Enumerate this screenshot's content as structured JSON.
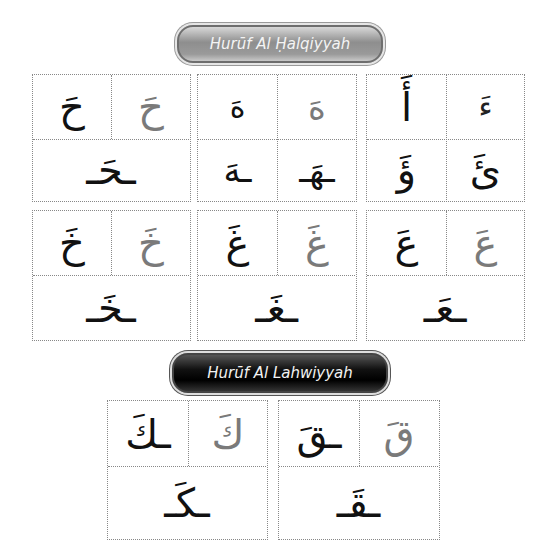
{
  "sections": [
    {
      "title": "Hurūf Al Ḥalqiyyah",
      "groups": [
        {
          "top_left": "حَ",
          "top_right": "حَ",
          "bottom": "ـحَـ"
        },
        {
          "top_left": "هَ",
          "top_right": "هَ",
          "bottom_left": "ـهَ",
          "bottom_right": "ـهَـ"
        },
        {
          "top_left": "أَ",
          "top_right": "ءَ",
          "bottom_left": "ؤَ",
          "bottom_right": "ئَ"
        },
        {
          "top_left": "خَ",
          "top_right": "خَ",
          "bottom": "ـخَـ"
        },
        {
          "top_left": "غَ",
          "top_right": "غَ",
          "bottom": "ـغَـ"
        },
        {
          "top_left": "عَ",
          "top_right": "عَ",
          "bottom": "ـعَـ"
        }
      ]
    },
    {
      "title": "Hurūf Al Lahwiyyah",
      "groups": [
        {
          "top_left": "ـكَ",
          "top_right": "كَ",
          "bottom": "ـكَـ"
        },
        {
          "top_left": "ـقَ",
          "top_right": "قَ",
          "bottom": "ـقَـ"
        }
      ]
    }
  ]
}
